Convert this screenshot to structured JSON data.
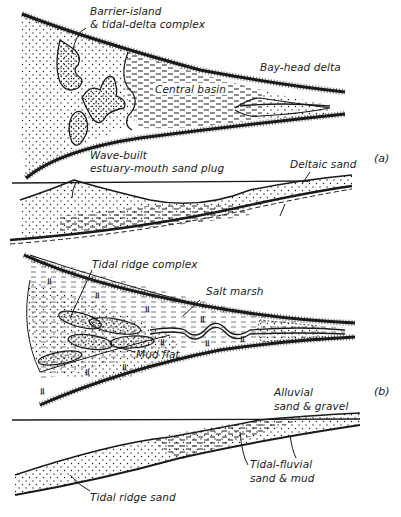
{
  "figure": {
    "panels": [
      {
        "id": "a",
        "label": "(a)",
        "plan_view_labels": {
          "barrier": "Barrier-island",
          "barrier2": "& tidal-delta complex",
          "bayhead": "Bay-head delta",
          "central": "Central basin"
        },
        "section_labels": {
          "wave1": "Wave-built",
          "wave2": "estuary-mouth sand plug",
          "deltaic": "Deltaic sand"
        }
      },
      {
        "id": "b",
        "label": "(b)",
        "plan_view_labels": {
          "ridge": "Tidal ridge complex",
          "saltmarsh": "Salt marsh",
          "mudflat": "Mud flat"
        },
        "section_labels": {
          "alluvial1": "Alluvial",
          "alluvial2": "sand & gravel",
          "tidalfluvial1": "Tidal-fluvial",
          "tidalfluvial2": "sand & mud",
          "ridgesand": "Tidal ridge sand"
        }
      }
    ],
    "colors": {
      "ink": "#1a1a1a",
      "paper": "#ffffff"
    }
  }
}
